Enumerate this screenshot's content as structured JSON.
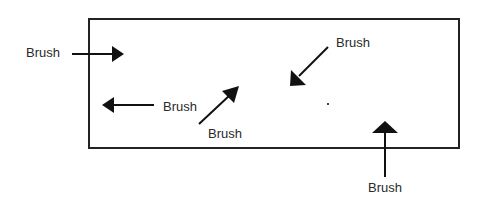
{
  "diagram": {
    "type": "brush-stroke-directions",
    "frame": {
      "x": 89,
      "y": 19,
      "width": 370,
      "height": 129,
      "stroke": "#222222"
    },
    "arrows": [
      {
        "id": "arrow-1",
        "direction": "right",
        "label": "Brush",
        "label_pos": {
          "x": 26,
          "y": 45
        },
        "line": {
          "x1": 72,
          "y1": 54,
          "x2": 112,
          "y2": 54
        },
        "head": "112,46 124,54 112,62"
      },
      {
        "id": "arrow-2",
        "direction": "left",
        "label": "Brush",
        "label_pos": {
          "x": 163,
          "y": 99
        },
        "line": {
          "x1": 154,
          "y1": 105,
          "x2": 114,
          "y2": 105
        },
        "head": "114,97 102,105 114,113"
      },
      {
        "id": "arrow-3",
        "direction": "up-right",
        "label": "Brush",
        "label_pos": {
          "x": 208,
          "y": 126
        },
        "line": {
          "x1": 199,
          "y1": 124,
          "x2": 230,
          "y2": 95
        },
        "head": "222,91 239,86 234,103"
      },
      {
        "id": "arrow-4",
        "direction": "down-left",
        "label": "Brush",
        "label_pos": {
          "x": 336,
          "y": 35
        },
        "line": {
          "x1": 328,
          "y1": 47,
          "x2": 299,
          "y2": 76
        },
        "head": "291,70 290,86 306,85"
      },
      {
        "id": "arrow-5",
        "direction": "up",
        "label": "Brush",
        "label_pos": {
          "x": 368,
          "y": 180
        },
        "line": {
          "x1": 385,
          "y1": 177,
          "x2": 385,
          "y2": 132
        },
        "head": "372,133 385,121 398,133"
      }
    ],
    "marks": [
      {
        "id": "dot",
        "x": 328,
        "y": 104
      }
    ]
  }
}
